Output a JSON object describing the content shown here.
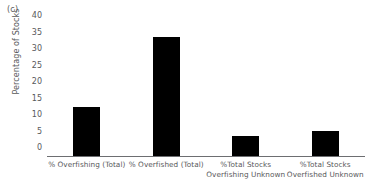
{
  "panel": {
    "label": "(c)"
  },
  "chart_data": {
    "type": "bar",
    "title": "",
    "subtitle": "",
    "panel_label": "(c)",
    "xlabel": "",
    "ylabel": "Percentage of Stocks",
    "ylim": [
      0,
      40
    ],
    "ytick_step": 5,
    "yticks": [
      "40",
      "35",
      "30",
      "25",
      "20",
      "15",
      "10",
      "5",
      "0"
    ],
    "grid": false,
    "legend": null,
    "bar_color": "#000000",
    "axis_color": "#6d6e71",
    "text_color": "#58595b",
    "categories": [
      "% Overfishing (Total)",
      "% Overfished (Total)",
      "%Total Stocks Overfishing Unknown",
      "%Total Stocks Overfished Unknown"
    ],
    "category_lines": [
      [
        "% Overfishing (Total)",
        ""
      ],
      [
        "% Overfished (Total)",
        ""
      ],
      [
        "%Total Stocks",
        "Overfishing Unknown"
      ],
      [
        "%Total Stocks",
        "Overfished Unknown"
      ]
    ],
    "values": [
      15,
      36,
      6,
      7.5
    ]
  }
}
